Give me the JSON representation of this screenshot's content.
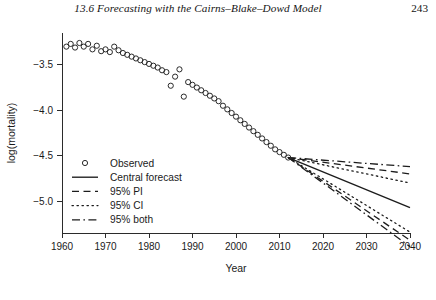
{
  "running_head": {
    "title": "13.6  Forecasting with the Cairns–Blake–Dowd Model",
    "page_number": "243"
  },
  "chart_data": {
    "type": "scatter",
    "title": "",
    "xlabel": "Year",
    "ylabel": "log(mortality)",
    "xlim": [
      1960,
      2040
    ],
    "ylim": [
      -5.35,
      -3.15
    ],
    "xticks": [
      1960,
      1970,
      1980,
      1990,
      2000,
      2010,
      2020,
      2030,
      2040
    ],
    "xtick_labels": [
      "1960",
      "1970",
      "1980",
      "1990",
      "2000",
      "2010",
      "2020",
      "2030",
      "2040"
    ],
    "yticks": [
      -3.5,
      -4.0,
      -4.5,
      -5.0
    ],
    "ytick_labels": [
      "−3.5",
      "−4.0",
      "−4.5",
      "−5.0"
    ],
    "grid": false,
    "legend_position": "center-left-inside",
    "legend": [
      {
        "label": "Observed",
        "marker": "open-circle",
        "style": "none"
      },
      {
        "label": "Central forecast",
        "marker": "none",
        "style": "solid"
      },
      {
        "label": "95% PI",
        "marker": "none",
        "style": "dashed"
      },
      {
        "label": "95% CI",
        "marker": "none",
        "style": "dotted"
      },
      {
        "label": "95% both",
        "marker": "none",
        "style": "dash-dot"
      }
    ],
    "series": [
      {
        "name": "Observed",
        "style": "open-circle-markers",
        "x": [
          1961,
          1962,
          1963,
          1964,
          1965,
          1966,
          1967,
          1968,
          1969,
          1970,
          1971,
          1972,
          1973,
          1974,
          1975,
          1976,
          1977,
          1978,
          1979,
          1980,
          1981,
          1982,
          1983,
          1984,
          1985,
          1986,
          1987,
          1988,
          1989,
          1990,
          1991,
          1992,
          1993,
          1994,
          1995,
          1996,
          1997,
          1998,
          1999,
          2000,
          2001,
          2002,
          2003,
          2004,
          2005,
          2006,
          2007,
          2008,
          2009,
          2010,
          2011,
          2012
        ],
        "y": [
          -3.3,
          -3.27,
          -3.31,
          -3.26,
          -3.3,
          -3.27,
          -3.33,
          -3.29,
          -3.35,
          -3.33,
          -3.36,
          -3.3,
          -3.34,
          -3.37,
          -3.39,
          -3.41,
          -3.43,
          -3.45,
          -3.47,
          -3.49,
          -3.51,
          -3.53,
          -3.56,
          -3.58,
          -3.73,
          -3.63,
          -3.55,
          -3.85,
          -3.69,
          -3.72,
          -3.75,
          -3.78,
          -3.81,
          -3.84,
          -3.87,
          -3.9,
          -3.95,
          -3.99,
          -4.03,
          -4.07,
          -4.11,
          -4.15,
          -4.19,
          -4.23,
          -4.27,
          -4.31,
          -4.35,
          -4.39,
          -4.43,
          -4.46,
          -4.49,
          -4.52
        ]
      },
      {
        "name": "Central forecast",
        "style": "solid",
        "x": [
          2012,
          2040
        ],
        "y": [
          -4.52,
          -5.07
        ]
      },
      {
        "name": "95% PI upper",
        "style": "dashed",
        "x": [
          2012,
          2040
        ],
        "y": [
          -4.52,
          -4.7
        ]
      },
      {
        "name": "95% PI lower",
        "style": "dashed",
        "x": [
          2012,
          2040
        ],
        "y": [
          -4.52,
          -5.43
        ]
      },
      {
        "name": "95% CI upper",
        "style": "dotted",
        "x": [
          2012,
          2040
        ],
        "y": [
          -4.52,
          -4.8
        ]
      },
      {
        "name": "95% CI lower",
        "style": "dotted",
        "x": [
          2012,
          2040
        ],
        "y": [
          -4.52,
          -5.34
        ]
      },
      {
        "name": "95% both upper",
        "style": "dash-dot",
        "x": [
          2012,
          2040
        ],
        "y": [
          -4.52,
          -4.62
        ]
      },
      {
        "name": "95% both lower",
        "style": "dash-dot",
        "x": [
          2012,
          2040
        ],
        "y": [
          -4.52,
          -5.5
        ]
      }
    ]
  }
}
